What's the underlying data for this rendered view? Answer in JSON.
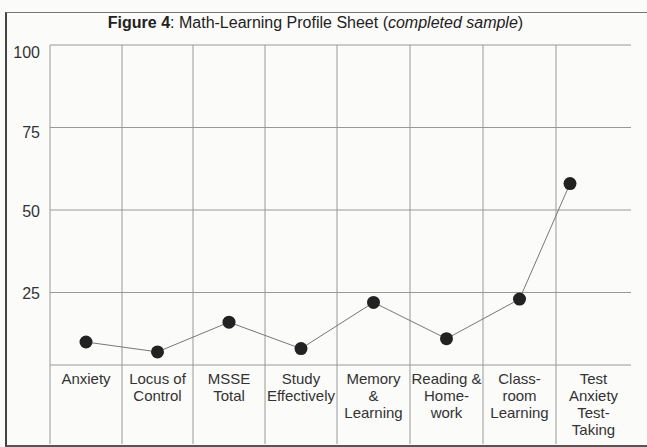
{
  "title": {
    "bold": "Figure 4",
    "plain": ":  Math-Learning Profile Sheet (",
    "italic": "completed sample",
    "close": ")"
  },
  "y_ticks": [
    "100",
    "75",
    "50",
    "25"
  ],
  "chart_data": {
    "type": "line",
    "title": "Figure 4: Math-Learning Profile Sheet (completed sample)",
    "xlabel": "",
    "ylabel": "",
    "ylim": [
      0,
      100
    ],
    "yticks": [
      25,
      50,
      75,
      100
    ],
    "grid": true,
    "categories": [
      "Anxiety",
      "Locus of Control",
      "MSSE Total",
      "Study Effectively",
      "Memory & Learning",
      "Reading & Home-work",
      "Class-room Learning",
      "Test Anxiety Test-Taking"
    ],
    "values": [
      10,
      7,
      16,
      8,
      22,
      11,
      23,
      58
    ],
    "marker": "filled-circle",
    "line_color": "#777777",
    "marker_color": "#222222"
  },
  "x_labels": [
    [
      "Anxiety"
    ],
    [
      "Locus of",
      "Control"
    ],
    [
      "MSSE",
      "Total"
    ],
    [
      "Study",
      "Effectively"
    ],
    [
      "Memory",
      "&",
      "Learning"
    ],
    [
      "Reading &",
      "Home-",
      "work"
    ],
    [
      "Class-",
      "room",
      "Learning"
    ],
    [
      "Test",
      "Anxiety",
      "Test-",
      "Taking"
    ]
  ]
}
